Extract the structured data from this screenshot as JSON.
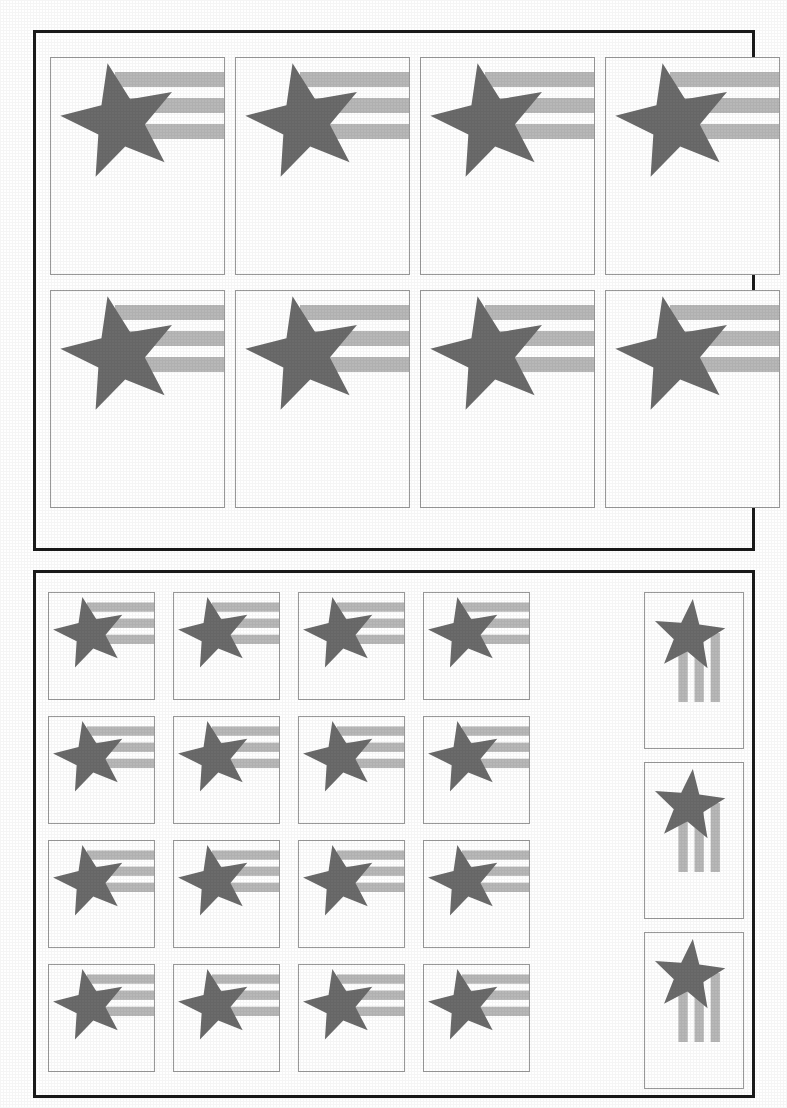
{
  "document": {
    "kind": "print-layout-sheet",
    "background_color": "#ffffff",
    "panel_border_color": "#1a1a1a",
    "cell_border_color": "#9a9a9a"
  },
  "motif": {
    "name": "star-and-stripes",
    "star_color": "#6b6b6b",
    "stripe_color": "#b8b8b8",
    "stripe_count": 3,
    "star_rotation_deg": -12,
    "description": "Dark gray five-pointed star overlapping three light gray horizontal stripes extending to the right"
  },
  "panels": [
    {
      "id": "panel-top",
      "name": "top-panel",
      "x": 33,
      "y": 30,
      "width": 722,
      "height": 521,
      "grid": {
        "columns": 4,
        "rows": 2
      },
      "cell": {
        "width": 175,
        "height": 218,
        "orientation": "portrait"
      },
      "cell_origin": {
        "x": 14,
        "y": 24
      },
      "cell_gap": {
        "x": 10,
        "y": 15
      },
      "motif_orientation": "horizontal",
      "motif_scale": 1.0,
      "motif_offset": {
        "x": 6,
        "y": 2
      },
      "cell_count": 8
    },
    {
      "id": "panel-bottom",
      "name": "bottom-panel",
      "x": 33,
      "y": 570,
      "width": 722,
      "height": 528,
      "grid": {
        "columns": 4,
        "rows": 4
      },
      "cell": {
        "width": 107,
        "height": 108,
        "orientation": "square"
      },
      "cell_origin": {
        "x": 12,
        "y": 19
      },
      "cell_gap": {
        "x": 18,
        "y": 16
      },
      "motif_orientation": "horizontal",
      "motif_scale": 0.62,
      "motif_offset": {
        "x": 2,
        "y": 2
      },
      "cell_count": 16,
      "extra_column": {
        "name": "rotated-column",
        "x": 608,
        "y": 19,
        "width": 100,
        "height": 157,
        "gap_y": 13,
        "count": 3,
        "motif_orientation": "vertical",
        "motif_rotation_deg": 90,
        "motif_scale": 0.62,
        "description": "Narrow portrait cells with the motif rotated 90 degrees: stripes run vertically upward, star sits below-right"
      }
    }
  ],
  "counts": {
    "top_panel_cells": 8,
    "bottom_panel_square_cells": 16,
    "bottom_panel_rotated_cells": 3,
    "total_cells": 27
  }
}
